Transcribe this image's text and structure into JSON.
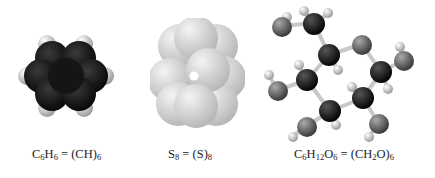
{
  "figure": {
    "molecules": [
      {
        "name": "benzene",
        "model_style": "space-filling",
        "colors": {
          "carbon": "#1a1a1a",
          "hydrogen": "#d8d8d8"
        },
        "caption": {
          "lhs": [
            {
              "t": "C"
            },
            {
              "s": "6"
            },
            {
              "t": "H"
            },
            {
              "s": "6"
            }
          ],
          "eq": " = ",
          "rhs": [
            {
              "t": "(CH)"
            },
            {
              "s": "6"
            }
          ]
        }
      },
      {
        "name": "sulfur-octamer",
        "model_style": "space-filling",
        "colors": {
          "sulfur": "#c8c8c8"
        },
        "caption": {
          "lhs": [
            {
              "t": "S"
            },
            {
              "s": "8"
            }
          ],
          "eq": " = ",
          "rhs": [
            {
              "t": "(S)"
            },
            {
              "s": "8"
            }
          ]
        }
      },
      {
        "name": "glucose",
        "model_style": "ball-and-stick",
        "colors": {
          "carbon": "#111111",
          "oxygen": "#555555",
          "hydrogen": "#dddddd",
          "bond": "#cccccc"
        },
        "caption": {
          "lhs": [
            {
              "t": "C"
            },
            {
              "s": "6"
            },
            {
              "t": "H"
            },
            {
              "s": "12"
            },
            {
              "t": "O"
            },
            {
              "s": "6"
            }
          ],
          "eq": " = ",
          "rhs": [
            {
              "t": "(CH"
            },
            {
              "s": "2"
            },
            {
              "t": "O)"
            },
            {
              "s": "6"
            }
          ]
        }
      }
    ]
  }
}
